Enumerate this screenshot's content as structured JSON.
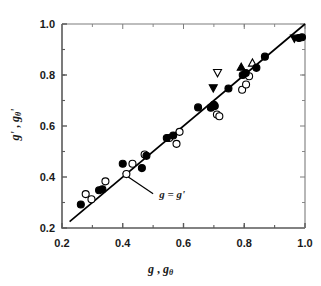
{
  "chart_data": {
    "type": "scatter",
    "title": "",
    "xlabel": "g , gθ",
    "ylabel": "g' , gθ'",
    "xlim": [
      0.2,
      1.0
    ],
    "ylim": [
      0.2,
      1.0
    ],
    "xticks": [
      "0.2",
      "0.4",
      "0.6",
      "0.8",
      "1.0"
    ],
    "xtick_values": [
      0.2,
      0.4,
      0.6,
      0.8,
      1.0
    ],
    "yticks": [
      "0.2",
      "0.4",
      "0.6",
      "0.8",
      "1.0"
    ],
    "ytick_values": [
      0.2,
      0.4,
      0.6,
      0.8,
      1.0
    ],
    "minor_tick_step": 0.1,
    "grid": false,
    "legend": "none",
    "annotations": [
      {
        "text": "g = g'",
        "x": 0.5,
        "y": 0.335,
        "arrow_from_x": 0.5,
        "arrow_from_y": 0.35,
        "arrow_to_x": 0.4,
        "arrow_to_y": 0.415
      }
    ],
    "reference_line": {
      "label": "g = g'",
      "type": "identity",
      "x": [
        0.225,
        1.0
      ],
      "y": [
        0.225,
        1.0
      ]
    },
    "series": [
      {
        "name": "filled-circle",
        "marker": "circle",
        "fill": "#000000",
        "points": [
          [
            0.262,
            0.292
          ],
          [
            0.322,
            0.348
          ],
          [
            0.333,
            0.352
          ],
          [
            0.4,
            0.452
          ],
          [
            0.463,
            0.435
          ],
          [
            0.478,
            0.483
          ],
          [
            0.545,
            0.553
          ],
          [
            0.566,
            0.563
          ],
          [
            0.648,
            0.673
          ],
          [
            0.69,
            0.672
          ],
          [
            0.7,
            0.683
          ],
          [
            0.703,
            0.678
          ],
          [
            0.748,
            0.747
          ],
          [
            0.795,
            0.8
          ],
          [
            0.805,
            0.808
          ],
          [
            0.84,
            0.828
          ],
          [
            0.868,
            0.872
          ],
          [
            0.98,
            0.945
          ],
          [
            0.99,
            0.948
          ]
        ]
      },
      {
        "name": "open-circle",
        "marker": "circle",
        "fill": "#ffffff",
        "points": [
          [
            0.278,
            0.333
          ],
          [
            0.297,
            0.313
          ],
          [
            0.343,
            0.383
          ],
          [
            0.412,
            0.412
          ],
          [
            0.432,
            0.452
          ],
          [
            0.472,
            0.488
          ],
          [
            0.553,
            0.553
          ],
          [
            0.577,
            0.53
          ],
          [
            0.587,
            0.577
          ],
          [
            0.71,
            0.645
          ],
          [
            0.718,
            0.638
          ],
          [
            0.793,
            0.742
          ],
          [
            0.806,
            0.763
          ],
          [
            0.816,
            0.795
          ]
        ]
      },
      {
        "name": "filled-down-triangle",
        "marker": "triangle-down",
        "fill": "#000000",
        "points": [
          [
            0.698,
            0.748
          ],
          [
            0.965,
            0.943
          ]
        ]
      },
      {
        "name": "open-down-triangle",
        "marker": "triangle-down",
        "fill": "#ffffff",
        "points": [
          [
            0.712,
            0.808
          ]
        ]
      },
      {
        "name": "filled-up-triangle",
        "marker": "triangle-up",
        "fill": "#000000",
        "points": [
          [
            0.79,
            0.832
          ]
        ]
      },
      {
        "name": "open-up-triangle",
        "marker": "triangle-up",
        "fill": "#ffffff",
        "points": [
          [
            0.827,
            0.848
          ]
        ]
      }
    ]
  },
  "axes": {
    "x_label_main": "g",
    "x_label_sep": " , ",
    "x_label_sub_base": "g",
    "x_label_sub": "θ",
    "y_label_main": "g'",
    "y_label_sep": " , ",
    "y_label_sub_base": "g",
    "y_label_sub": "θ",
    "y_label_sub_prime": "'"
  },
  "colors": {
    "ink": "#1a1a1a",
    "marker": "#000000",
    "background": "#ffffff"
  }
}
